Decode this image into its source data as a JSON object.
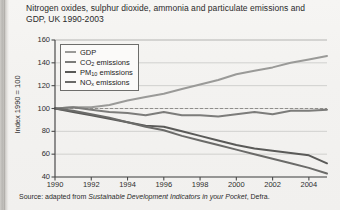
{
  "figure": {
    "title": "Nitrogen oxides, sulphur dioxide, ammonia and particulate emissions and GDP, UK 1990-2003",
    "source_prefix": "Source: adapted from ",
    "source_italic": "Sustainable Development Indicators in your Pocket",
    "source_suffix": ", Defra."
  },
  "chart_data": {
    "type": "line",
    "title": "Nitrogen oxides, sulphur dioxide, ammonia and particulate emissions and GDP, UK 1990-2003",
    "xlabel": "",
    "ylabel": "Index 1990 = 100",
    "xlim": [
      1990,
      2005
    ],
    "ylim": [
      40,
      160
    ],
    "grid": true,
    "legend_position": "top-left",
    "reference_line": 100,
    "x": [
      1990,
      1991,
      1992,
      1993,
      1994,
      1995,
      1996,
      1997,
      1998,
      1999,
      2000,
      2001,
      2002,
      2003,
      2004,
      2005
    ],
    "xticks": [
      1990,
      1992,
      1994,
      1996,
      1998,
      2000,
      2002,
      2004
    ],
    "yticks": [
      40,
      60,
      80,
      100,
      120,
      140,
      160
    ],
    "series": [
      {
        "name": "GDP",
        "color": "#9a9a98",
        "values": [
          100,
          101,
          101,
          103,
          107,
          110,
          113,
          117,
          121,
          125,
          130,
          133,
          136,
          140,
          143,
          146
        ]
      },
      {
        "name": "CO2 emissions",
        "label_main": "CO",
        "label_sub": "2",
        "label_tail": " emissions",
        "color": "#7c7c7a",
        "values": [
          100,
          101,
          99,
          97,
          96,
          94,
          97,
          94,
          94,
          93,
          95,
          97,
          95,
          98,
          98,
          99
        ]
      },
      {
        "name": "PM10 emissions",
        "label_main": "PM",
        "label_sub": "10",
        "label_tail": " emissions",
        "color": "#5a5a58",
        "values": [
          100,
          97,
          94,
          91,
          88,
          85,
          84,
          80,
          76,
          72,
          68,
          65,
          63,
          61,
          59,
          52
        ]
      },
      {
        "name": "NOx emissions",
        "label_main": "NO",
        "label_sub": "x",
        "label_tail": " emissions",
        "color": "#6b6b69",
        "values": [
          100,
          98,
          95,
          92,
          88,
          84,
          81,
          76,
          72,
          68,
          64,
          60,
          56,
          52,
          48,
          43
        ]
      }
    ]
  },
  "legend": {
    "items": [
      {
        "label": "GDP",
        "main": "GDP",
        "sub": "",
        "tail": ""
      },
      {
        "label": "CO2 emissions",
        "main": "CO",
        "sub": "2",
        "tail": " emissions"
      },
      {
        "label": "PM10 emissions",
        "main": "PM",
        "sub": "10",
        "tail": " emissions"
      },
      {
        "label": "NOx emissions",
        "main": "NO",
        "sub": "x",
        "tail": " emissions"
      }
    ]
  }
}
